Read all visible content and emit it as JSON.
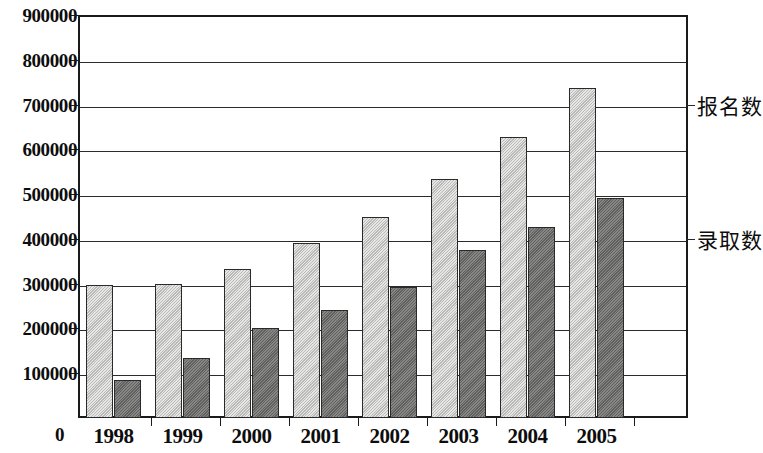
{
  "chart_data": {
    "type": "bar",
    "title": "",
    "subtitle": "",
    "xlabel": "",
    "ylabel": "",
    "categories": [
      "1998",
      "1999",
      "2000",
      "2001",
      "2002",
      "2003",
      "2004",
      "2005"
    ],
    "series": [
      {
        "name": "报名数",
        "color": "#c9c9c7",
        "values": [
          298000,
          300000,
          333000,
          390000,
          450000,
          534000,
          627000,
          736000
        ]
      },
      {
        "name": "录取数",
        "color": "#70706e",
        "values": [
          85000,
          133000,
          200000,
          242000,
          292000,
          376000,
          426000,
          491000
        ]
      }
    ],
    "ylim": [
      0,
      900000
    ],
    "ytick_values": [
      0,
      100000,
      200000,
      300000,
      400000,
      500000,
      600000,
      700000,
      800000,
      900000
    ],
    "ytick_labels": [
      "0",
      "100000",
      "200000",
      "300000",
      "400000",
      "500000",
      "600000",
      "700000",
      "800000",
      "900000"
    ],
    "grid": true,
    "legend_position": "right-inline",
    "annotations": [
      {
        "text": "报名数",
        "value": 700000
      },
      {
        "text": "录取数",
        "value": 400000
      }
    ]
  },
  "axes": {
    "y_zero_label": "0"
  }
}
